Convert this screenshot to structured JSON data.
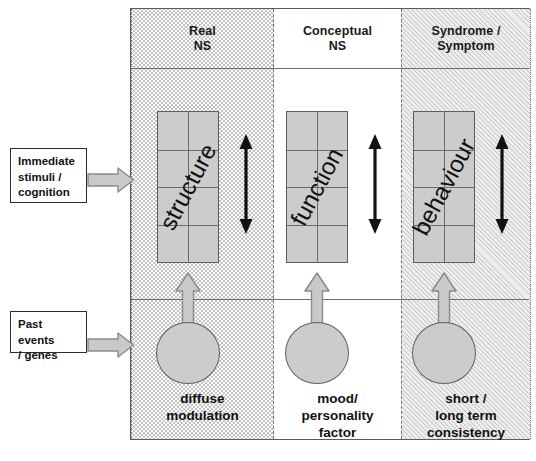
{
  "diagram": {
    "columns": [
      {
        "id": "real-ns",
        "header": "Real\nNS",
        "pattern": "dotted"
      },
      {
        "id": "conceptual-ns",
        "header": "Conceptual\nNS",
        "pattern": "plain"
      },
      {
        "id": "syndrome-symptom",
        "header": "Syndrome /\nSymptom",
        "pattern": "hatched"
      }
    ],
    "headers": {
      "real_ns_line1": "Real",
      "real_ns_line2": "NS",
      "conceptual_ns_line1": "Conceptual",
      "conceptual_ns_line2": "NS",
      "syndrome_line1": "Syndrome /",
      "syndrome_line2": "Symptom"
    },
    "grid_boxes": [
      {
        "id": "structure",
        "label": "structure",
        "rows": 4,
        "cols": 2
      },
      {
        "id": "function",
        "label": "function",
        "rows": 4,
        "cols": 2
      },
      {
        "id": "behaviour",
        "label": "behaviour",
        "rows": 4,
        "cols": 2
      }
    ],
    "captions": [
      {
        "id": "diffuse-modulation",
        "line1": "diffuse",
        "line2": "modulation",
        "line3": ""
      },
      {
        "id": "mood-personality",
        "line1": "mood/",
        "line2": "personality",
        "line3": "factor"
      },
      {
        "id": "short-long-term",
        "line1": "short /",
        "line2": "long term",
        "line3": "consistency"
      }
    ],
    "inputs": [
      {
        "id": "immediate-stimuli",
        "line1": "Immediate",
        "line2": "stimuli /",
        "line3": "cognition"
      },
      {
        "id": "past-events",
        "line1": "Past events",
        "line2": "/ genes",
        "line3": ""
      }
    ],
    "arrow_labels": {
      "double_vertical": "bidirectional-relation",
      "block_up": "influences-upward",
      "block_right": "input-influence"
    },
    "colors": {
      "box_fill": "#cccccc",
      "box_stroke": "#5e5e5e",
      "frame_stroke": "#5a5a5a",
      "arrow_gray_fill": "#c9c9c9",
      "arrow_gray_stroke": "#8a8a8a",
      "arrow_black": "#111111",
      "hatch_bg": "#ededed",
      "text": "#111111"
    }
  }
}
